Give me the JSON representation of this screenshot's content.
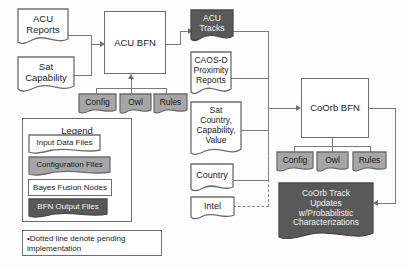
{
  "diagram": {
    "colors": {
      "input_file_fill": "#ffffff",
      "config_file_fill": "#a6a6a6",
      "bfn_node_fill": "#ffffff",
      "output_file_fill": "#595959",
      "stroke": "#6d6d6d",
      "connector": "#7a7a7a",
      "text_dark": "#1b1b1b",
      "text_light": "#2a2a2a"
    },
    "inputs_left": [
      {
        "id": "acu-reports",
        "lines": [
          "ACU",
          "Reports"
        ],
        "kind": "input-data-file"
      },
      {
        "id": "sat-capability",
        "lines": [
          "Sat",
          "Capability"
        ],
        "kind": "input-data-file"
      }
    ],
    "bfn_nodes": [
      {
        "id": "acu-bfn",
        "label": "ACU BFN",
        "kind": "bayes-fusion-node"
      },
      {
        "id": "coorb-bfn",
        "label": "CoOrb BFN",
        "kind": "bayes-fusion-node"
      }
    ],
    "acu_config_files": [
      {
        "id": "acu-config",
        "label": "Config",
        "kind": "configuration-file"
      },
      {
        "id": "acu-owl",
        "label": "Owl",
        "kind": "configuration-file"
      },
      {
        "id": "acu-rules",
        "label": "Rules",
        "kind": "configuration-file"
      }
    ],
    "coorb_config_files": [
      {
        "id": "coorb-config",
        "label": "Config",
        "kind": "configuration-file"
      },
      {
        "id": "coorb-owl",
        "label": "Owl",
        "kind": "configuration-file"
      },
      {
        "id": "coorb-rules",
        "label": "Rules",
        "kind": "configuration-file"
      }
    ],
    "middle_column": [
      {
        "id": "acu-tracks",
        "lines": [
          "ACU",
          "Tracks"
        ],
        "kind": "bfn-output-file"
      },
      {
        "id": "caos-d-proximity-reports",
        "lines": [
          "CAOS-D",
          "Proximity",
          "Reports"
        ],
        "kind": "input-data-file"
      },
      {
        "id": "sat-country-capability-value",
        "lines": [
          "Sat",
          "Country,",
          "Capability,",
          "Value"
        ],
        "kind": "input-data-file"
      },
      {
        "id": "country",
        "lines": [
          "Country"
        ],
        "kind": "input-data-file"
      },
      {
        "id": "intel",
        "lines": [
          "Intel"
        ],
        "kind": "input-data-file"
      }
    ],
    "outputs": [
      {
        "id": "coorb-track-updates",
        "lines": [
          "CoOrb Track",
          "Updates",
          "w/Probabilistic",
          "Characterizations"
        ],
        "kind": "bfn-output-file"
      }
    ],
    "legend": {
      "title": "Legend",
      "items": [
        {
          "label": "Input Data Files",
          "kind": "input-data-file"
        },
        {
          "label": "Configuration Files",
          "kind": "configuration-file"
        },
        {
          "label": "Bayes Fusion Nodes",
          "kind": "bayes-fusion-node"
        },
        {
          "label": "BFN Output Files",
          "kind": "bfn-output-file"
        }
      ]
    },
    "note": {
      "bullet": "•",
      "text": "Dotted line denote pending implementation"
    }
  }
}
